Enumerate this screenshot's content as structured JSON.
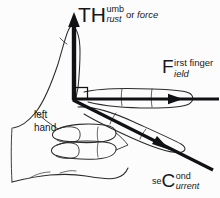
{
  "diagram": {
    "background_color": "#fcfcfc",
    "ink_color": "#17181a",
    "outline_color": "#2b2b2b",
    "labels": {
      "thrust": {
        "big": "TH",
        "sup": "umb",
        "sub": "rust",
        "tail_plain": "or ",
        "tail_italic": "force"
      },
      "first_finger": {
        "big": "F",
        "sup": "irst finger",
        "sub": "ield"
      },
      "second_finger": {
        "pre": "se",
        "big": "C",
        "sup": "ond",
        "sub": "urrent"
      },
      "hand": {
        "line1": "left",
        "line2": "hand"
      }
    },
    "axes": [
      {
        "name": "thrust-axis",
        "direction": "up",
        "from": [
          74,
          99
        ],
        "to": [
          74,
          14
        ],
        "arrowhead": true,
        "meaning": "Thrust or force"
      },
      {
        "name": "field-axis",
        "direction": "right",
        "from": [
          74,
          99
        ],
        "to": [
          219,
          99
        ],
        "arrowhead_at": [
          181,
          99
        ],
        "meaning": "First finger - Field"
      },
      {
        "name": "current-axis",
        "direction": "down-right",
        "from": [
          74,
          99
        ],
        "to": [
          212,
          169
        ],
        "arrowhead_at": [
          168,
          148
        ],
        "meaning": "seCond finger - Current"
      }
    ],
    "right_angle_marker": {
      "x": 75,
      "y": 87,
      "size": 13
    }
  }
}
